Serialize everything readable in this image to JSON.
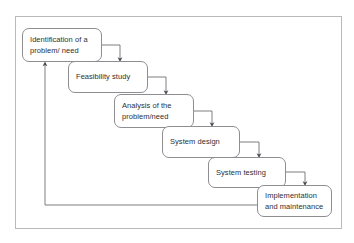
{
  "page": {
    "cut_off_caption": "",
    "background_color": "#ffffff",
    "frame_color": "#b9b9bd",
    "box_border_color": "#8d8d92",
    "connector_color": "#6f6f74",
    "text_color": "#2f2f33"
  },
  "diagram": {
    "type": "waterfall-lifecycle",
    "stages": [
      {
        "index": 1,
        "name": "identification",
        "lines": [
          "Identification of a",
          "problem/ need"
        ],
        "x": 22,
        "y": 28,
        "w": 80,
        "h": 34
      },
      {
        "index": 2,
        "name": "feasibility",
        "lines": [
          "Feasibility study",
          ""
        ],
        "x": 68,
        "y": 61,
        "w": 80,
        "h": 32
      },
      {
        "index": 3,
        "name": "analysis",
        "lines": [
          "Analysis of the",
          "problem/need"
        ],
        "x": 114,
        "y": 94,
        "w": 80,
        "h": 34
      },
      {
        "index": 4,
        "name": "design",
        "lines": [
          "System design",
          ""
        ],
        "x": 162,
        "y": 126,
        "w": 78,
        "h": 32
      },
      {
        "index": 5,
        "name": "testing",
        "lines": [
          "System testing",
          ""
        ],
        "x": 208,
        "y": 157,
        "w": 78,
        "h": 31
      },
      {
        "index": 6,
        "name": "implementation",
        "lines": [
          "Implementation",
          "and maintenance"
        ],
        "x": 257,
        "y": 185,
        "w": 75,
        "h": 32
      }
    ],
    "connectors": [
      {
        "from": "identification",
        "to": "feasibility",
        "style": "right-then-down"
      },
      {
        "from": "feasibility",
        "to": "analysis",
        "style": "right-then-down"
      },
      {
        "from": "analysis",
        "to": "design",
        "style": "right-then-down"
      },
      {
        "from": "design",
        "to": "testing",
        "style": "right-then-down"
      },
      {
        "from": "testing",
        "to": "implementation",
        "style": "right-then-down"
      }
    ],
    "feedback_loop": {
      "from": "implementation",
      "to": "identification",
      "style": "left-then-up",
      "label": ""
    }
  }
}
